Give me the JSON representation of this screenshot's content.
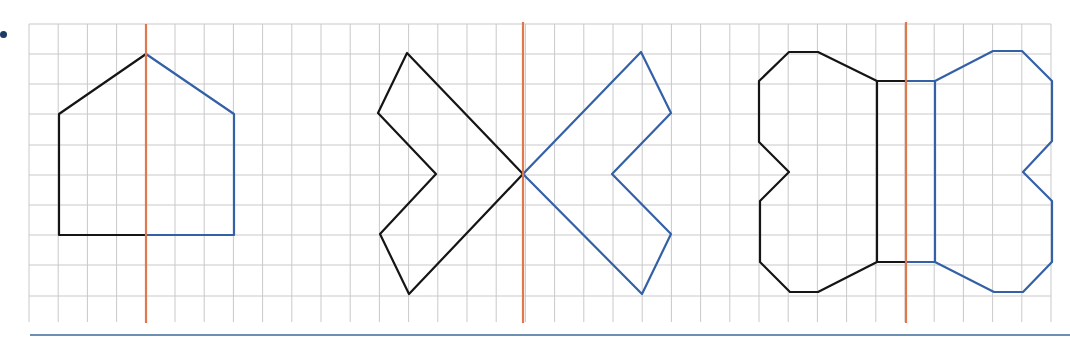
{
  "colors": {
    "grid": "#c9c9c9",
    "axis": "#e0784e",
    "original": "#151515",
    "reflection": "#3460a8",
    "bullet": "#1c3a66",
    "rule": "#6d8fb0"
  },
  "grid": {
    "x_start": 29,
    "x_step": 29.2,
    "x_lines": 36,
    "y_lines_px": [
      24,
      54,
      84,
      114,
      145,
      175,
      205,
      235,
      265,
      296
    ],
    "y_top": 24,
    "y_bottom": 322
  },
  "figures": [
    {
      "name": "house",
      "axis_x": 146,
      "axis_y": [
        24,
        323
      ],
      "original": [
        [
          146,
          54
        ],
        [
          59,
          114
        ],
        [
          59,
          235
        ],
        [
          146,
          235
        ]
      ],
      "reflection": [
        [
          146,
          54
        ],
        [
          234,
          114
        ],
        [
          234,
          235
        ],
        [
          146,
          235
        ]
      ]
    },
    {
      "name": "bow",
      "axis_x": 523,
      "axis_y": [
        22,
        323
      ],
      "original": [
        [
          523,
          174
        ],
        [
          407,
          53
        ],
        [
          378,
          113
        ],
        [
          436,
          174
        ],
        [
          380,
          234
        ],
        [
          409,
          294
        ],
        [
          523,
          174
        ]
      ],
      "reflection": [
        [
          523,
          174
        ],
        [
          641,
          52
        ],
        [
          671,
          113
        ],
        [
          612,
          174
        ],
        [
          671,
          234
        ],
        [
          642,
          294
        ],
        [
          523,
          174
        ]
      ]
    },
    {
      "name": "bone",
      "axis_x": 906,
      "axis_y": [
        22,
        323
      ],
      "original": [
        [
          906,
          81
        ],
        [
          877,
          81
        ],
        [
          818,
          52
        ],
        [
          789,
          52
        ],
        [
          759,
          81
        ],
        [
          759,
          142
        ],
        [
          789,
          172
        ],
        [
          760,
          201
        ],
        [
          760,
          262
        ],
        [
          790,
          292
        ],
        [
          818,
          292
        ],
        [
          877,
          262
        ],
        [
          906,
          262
        ]
      ],
      "original_inner": [
        [
          877,
          81
        ],
        [
          877,
          262
        ]
      ],
      "reflection": [
        [
          906,
          81
        ],
        [
          935,
          81
        ],
        [
          993,
          51
        ],
        [
          1022,
          51
        ],
        [
          1052,
          81
        ],
        [
          1052,
          141
        ],
        [
          1023,
          172
        ],
        [
          1052,
          201
        ],
        [
          1052,
          262
        ],
        [
          1023,
          292
        ],
        [
          994,
          292
        ],
        [
          935,
          262
        ],
        [
          906,
          262
        ]
      ],
      "reflection_inner": [
        [
          935,
          81
        ],
        [
          935,
          262
        ]
      ]
    }
  ]
}
